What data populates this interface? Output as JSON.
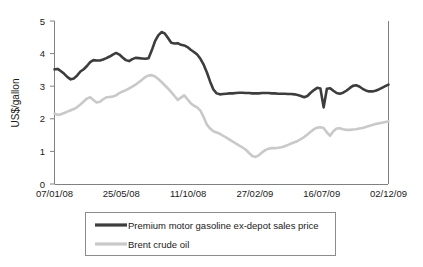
{
  "chart_data": {
    "type": "line",
    "title": "",
    "xlabel": "",
    "ylabel": "US$/gallon",
    "ylim": [
      0,
      5
    ],
    "yticks": [
      "0",
      "1",
      "2",
      "3",
      "4",
      "5"
    ],
    "xticks": [
      "07/01/08",
      "25/05/08",
      "11/10/08",
      "27/02/09",
      "16/07/09",
      "02/12/09"
    ],
    "grid": false,
    "legend_position": "bottom",
    "colors": {
      "premium_motor_gasoline": "#3d3d3d",
      "brent_crude_oil": "#c9c9c9",
      "axis": "#808080",
      "text": "#1a1a1a",
      "legend_border": "#8c8c8c"
    },
    "series": [
      {
        "name": "Premium motor gasoline ex-depot sales price",
        "color": "#3d3d3d",
        "values": [
          3.52,
          3.53,
          3.46,
          3.38,
          3.28,
          3.21,
          3.24,
          3.33,
          3.45,
          3.52,
          3.62,
          3.74,
          3.8,
          3.79,
          3.79,
          3.82,
          3.86,
          3.91,
          3.97,
          4.02,
          3.97,
          3.88,
          3.8,
          3.77,
          3.83,
          3.87,
          3.86,
          3.85,
          3.84,
          3.86,
          4.1,
          4.38,
          4.56,
          4.66,
          4.62,
          4.48,
          4.33,
          4.31,
          4.32,
          4.27,
          4.25,
          4.2,
          4.12,
          4.05,
          3.97,
          3.84,
          3.66,
          3.42,
          3.14,
          2.9,
          2.78,
          2.75,
          2.76,
          2.77,
          2.78,
          2.78,
          2.79,
          2.8,
          2.8,
          2.79,
          2.79,
          2.78,
          2.78,
          2.78,
          2.79,
          2.79,
          2.79,
          2.78,
          2.78,
          2.77,
          2.77,
          2.77,
          2.76,
          2.76,
          2.75,
          2.73,
          2.7,
          2.66,
          2.7,
          2.8,
          2.88,
          2.95,
          2.93,
          2.35,
          2.92,
          2.94,
          2.86,
          2.79,
          2.77,
          2.8,
          2.86,
          2.94,
          3.01,
          3.03,
          2.99,
          2.92,
          2.87,
          2.84,
          2.84,
          2.86,
          2.9,
          2.95,
          3.0,
          3.05
        ]
      },
      {
        "name": "Brent crude oil",
        "color": "#c9c9c9",
        "values": [
          2.16,
          2.12,
          2.14,
          2.18,
          2.22,
          2.26,
          2.3,
          2.36,
          2.44,
          2.53,
          2.62,
          2.66,
          2.58,
          2.5,
          2.52,
          2.6,
          2.66,
          2.67,
          2.68,
          2.72,
          2.79,
          2.84,
          2.88,
          2.93,
          2.99,
          3.05,
          3.12,
          3.2,
          3.28,
          3.33,
          3.34,
          3.3,
          3.22,
          3.13,
          3.03,
          2.93,
          2.82,
          2.7,
          2.58,
          2.65,
          2.72,
          2.6,
          2.48,
          2.4,
          2.35,
          2.25,
          2.05,
          1.82,
          1.7,
          1.62,
          1.58,
          1.54,
          1.48,
          1.42,
          1.36,
          1.3,
          1.24,
          1.18,
          1.12,
          1.05,
          0.95,
          0.86,
          0.83,
          0.88,
          0.97,
          1.04,
          1.08,
          1.1,
          1.1,
          1.11,
          1.13,
          1.16,
          1.2,
          1.24,
          1.28,
          1.32,
          1.38,
          1.44,
          1.52,
          1.6,
          1.68,
          1.73,
          1.74,
          1.72,
          1.58,
          1.48,
          1.62,
          1.7,
          1.71,
          1.68,
          1.66,
          1.66,
          1.67,
          1.68,
          1.7,
          1.72,
          1.75,
          1.78,
          1.81,
          1.84,
          1.86,
          1.88,
          1.9,
          1.92
        ]
      }
    ]
  },
  "legend": {
    "items": [
      {
        "label": "Premium motor gasoline ex-depot sales price",
        "color": "#3d3d3d"
      },
      {
        "label": "Brent crude oil",
        "color": "#c9c9c9"
      }
    ]
  }
}
